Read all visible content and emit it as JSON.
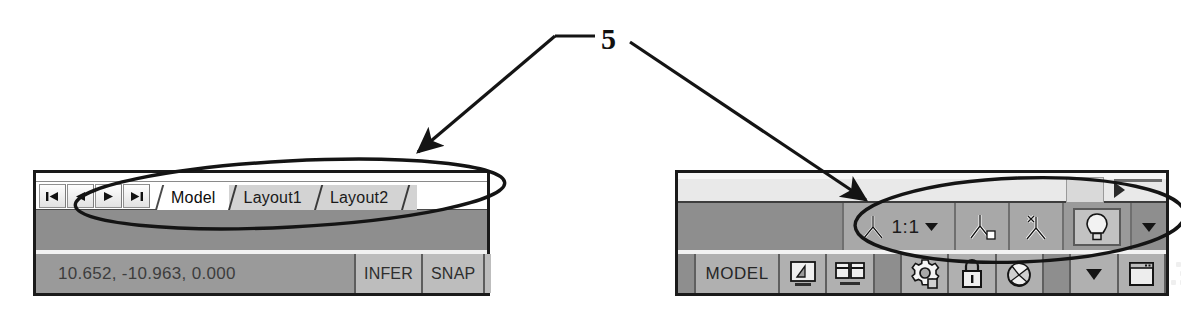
{
  "figure": {
    "callout_number": "5"
  },
  "left_panel": {
    "nav_buttons": [
      {
        "name": "first-tab-button",
        "icon": "first-arrow-icon",
        "label": "|◀"
      },
      {
        "name": "previous-tab-button",
        "icon": "previous-arrow-icon",
        "label": "◀"
      },
      {
        "name": "next-tab-button",
        "icon": "next-arrow-icon",
        "label": "▶"
      },
      {
        "name": "last-tab-button",
        "icon": "last-arrow-icon",
        "label": "▶|"
      }
    ],
    "tabs": [
      {
        "label": "Model",
        "active": true
      },
      {
        "label": "Layout1",
        "active": false
      },
      {
        "label": "Layout2",
        "active": false
      }
    ],
    "status_bar": {
      "coordinates": "10.652, -10.963, 0.000",
      "buttons": [
        "INFER",
        "SNAP",
        "G"
      ]
    }
  },
  "right_panel": {
    "toolbar": {
      "annotation_scale": {
        "icon": "annotation-scale-icon",
        "value": "1:1",
        "dropdown_icon": "chevron-down-icon"
      },
      "buttons": [
        {
          "name": "annotation-visibility-button",
          "icon": "annotation-visibility-icon"
        },
        {
          "name": "auto-scale-button",
          "icon": "auto-add-scale-icon"
        }
      ],
      "lightbulb": {
        "name": "annotation-monitor-button",
        "icon": "lightbulb-icon"
      },
      "overflow_icon": "chevron-down-icon"
    },
    "status_bar": {
      "space_label": "MODEL",
      "cells": [
        {
          "name": "quick-view-drawings-button",
          "icon": "quick-view-drawing-icon"
        },
        {
          "name": "quick-view-layouts-button",
          "icon": "quick-view-layouts-icon"
        },
        {
          "name": "application-status-menu-button",
          "icon": "gear-icon"
        },
        {
          "name": "toolbar-lock-button",
          "icon": "lock-icon"
        },
        {
          "name": "clean-screen-button",
          "icon": "clean-screen-icon"
        },
        {
          "name": "status-overflow-button",
          "icon": "chevron-down-icon"
        },
        {
          "name": "maximize-viewport-button",
          "icon": "window-icon"
        }
      ],
      "resize_grip_icon": "resize-grip-icon"
    },
    "scroll_row": {
      "scroll_thumb": "scroll-thumb",
      "scroll_arrow_icon": "play-right-icon"
    }
  },
  "colors": {
    "panel_border": "#1a1a1a",
    "toolbar_gray": "#8e8e8e",
    "button_gray": "#b0b0b0",
    "active_tab": "#ffffff",
    "inactive_tab": "#d3d3d3"
  }
}
